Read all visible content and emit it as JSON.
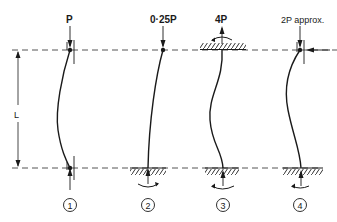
{
  "diagram": {
    "dimension_label": "L",
    "colors": {
      "ink": "#1a1a1a",
      "dash": "#555555",
      "background": "#ffffff"
    },
    "columns": [
      {
        "id": 1,
        "number": "1",
        "load_label": "P",
        "top": "pinned (guided)",
        "bottom": "pinned (guided)"
      },
      {
        "id": 2,
        "number": "2",
        "load_label": "0·25P",
        "top": "free",
        "bottom": "fixed"
      },
      {
        "id": 3,
        "number": "3",
        "load_label": "4P",
        "top": "fixed",
        "bottom": "fixed"
      },
      {
        "id": 4,
        "number": "4",
        "load_label": "2P approx.",
        "top": "pinned (guided, lateral restraint)",
        "bottom": "fixed"
      }
    ]
  }
}
